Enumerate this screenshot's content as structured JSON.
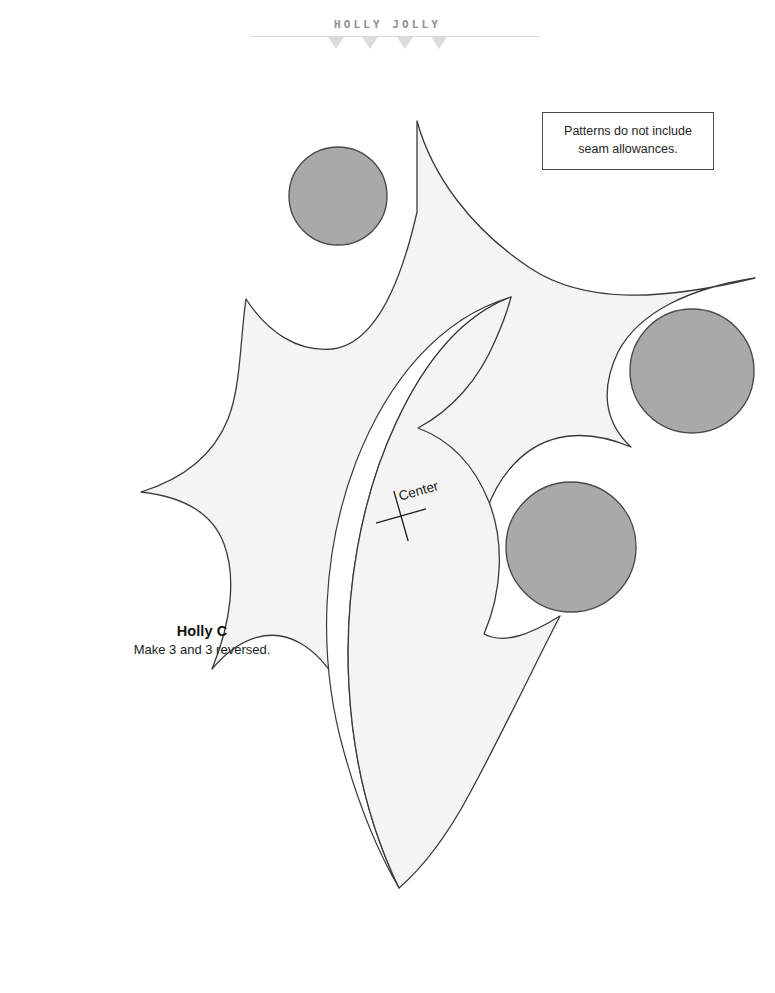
{
  "header": {
    "title": "HOLLY JOLLY",
    "rule": "horizontal-rule",
    "triangles": [
      {
        "name": "triangle-marker-1"
      },
      {
        "name": "triangle-marker-2"
      },
      {
        "name": "triangle-marker-3"
      },
      {
        "name": "triangle-marker-4"
      }
    ],
    "triangle_color": "#dcdcdc",
    "title_color": "#8e8e8e"
  },
  "note": {
    "line1": "Patterns do not include",
    "line2": "seam allowances.",
    "border_color": "#4a4a4a"
  },
  "pattern": {
    "name": "Holly C",
    "quantity": "Make 3 and 3 reversed.",
    "center_mark_label": "Center",
    "leaf_fill": "#f4f4f4",
    "leaf_stroke": "#3a3a3a",
    "berry_fill": "#a9a9a9",
    "berry_stroke": "#4b4b4b"
  },
  "berries": [
    {
      "name": "berry-top-left",
      "cx": 338,
      "cy": 196,
      "r": 49
    },
    {
      "name": "berry-right",
      "cx": 692,
      "cy": 371,
      "r": 62
    },
    {
      "name": "berry-bottom-right",
      "cx": 571,
      "cy": 547,
      "r": 65
    }
  ],
  "center_mark": {
    "name": "center-cross",
    "x": 401,
    "y": 516,
    "arm_length": 26,
    "rotation_deg": -16
  }
}
